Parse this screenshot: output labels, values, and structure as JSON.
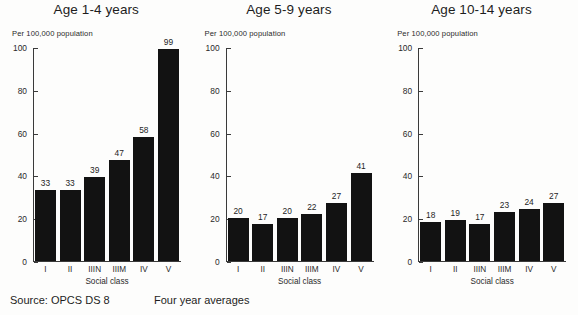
{
  "figure": {
    "unit_label": "Per 100,000 population",
    "x_axis_title": "Social class",
    "source_text": "Source: OPCS DS 8",
    "note_text": "Four year averages",
    "y_ticks": [
      "0",
      "20",
      "40",
      "60",
      "80",
      "100"
    ]
  },
  "chart_data": [
    {
      "type": "bar",
      "title": "Age 1-4 years",
      "categories": [
        "I",
        "II",
        "IIIN",
        "IIIM",
        "IV",
        "V"
      ],
      "values": [
        33,
        33,
        39,
        47,
        58,
        99
      ],
      "xlabel": "Social class",
      "ylabel": "Per 100,000 population",
      "ylim": [
        0,
        100
      ],
      "yticks": [
        0,
        20,
        40,
        60,
        80,
        100
      ],
      "grid": false,
      "legend": "none",
      "bar_color": "#121212"
    },
    {
      "type": "bar",
      "title": "Age 5-9 years",
      "categories": [
        "I",
        "II",
        "IIIN",
        "IIIM",
        "IV",
        "V"
      ],
      "values": [
        20,
        17,
        20,
        22,
        27,
        41
      ],
      "xlabel": "Social class",
      "ylabel": "Per 100,000 population",
      "ylim": [
        0,
        100
      ],
      "yticks": [
        0,
        20,
        40,
        60,
        80,
        100
      ],
      "grid": false,
      "legend": "none",
      "bar_color": "#121212"
    },
    {
      "type": "bar",
      "title": "Age 10-14 years",
      "categories": [
        "I",
        "II",
        "IIIN",
        "IIIM",
        "IV",
        "V"
      ],
      "values": [
        18,
        19,
        17,
        23,
        24,
        27
      ],
      "xlabel": "Social class",
      "ylabel": "Per 100,000 population",
      "ylim": [
        0,
        100
      ],
      "yticks": [
        0,
        20,
        40,
        60,
        80,
        100
      ],
      "grid": false,
      "legend": "none",
      "bar_color": "#121212"
    }
  ]
}
